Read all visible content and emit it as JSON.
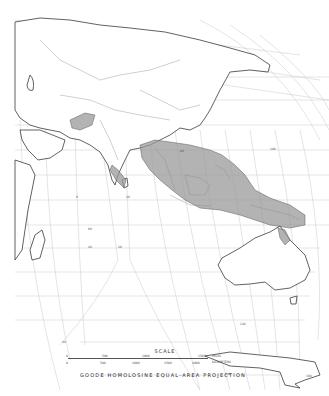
{
  "map": {
    "projection": "GOODE HOMOLOSINE EQUAL-AREA PROJECTION",
    "shaded_region_description": "Distribution range across Indian subcontinent, Southeast Asia, Indonesia and New Guinea",
    "colors": {
      "range_fill": "#9a9a9a",
      "coastline": "#3a3a3a",
      "graticule": "#c8c8c8",
      "background": "#ffffff"
    }
  },
  "scale": {
    "title": "SCALE",
    "miles_ticks": [
      "0",
      "500",
      "1000",
      "1500"
    ],
    "miles_unit": "MILES",
    "km_ticks": [
      "0",
      "500",
      "1000",
      "1500",
      "2000"
    ],
    "km_unit": "KILOMETERS"
  },
  "graticule_labels": [
    "40",
    "20",
    "0",
    "20",
    "40",
    "60",
    "80",
    "100",
    "120",
    "140",
    "160"
  ]
}
